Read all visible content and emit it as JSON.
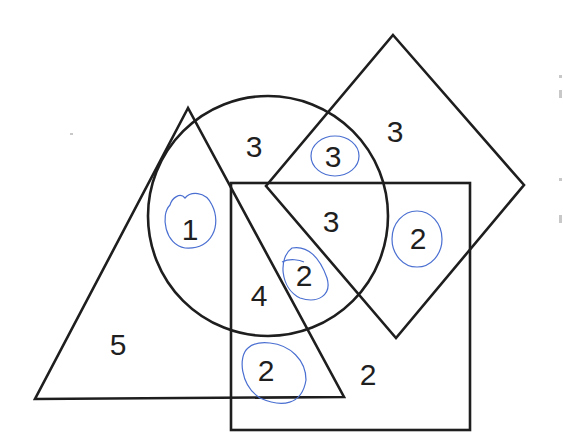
{
  "diagram": {
    "type": "venn-shapes",
    "shapes": [
      {
        "name": "triangle",
        "points": [
          [
            188,
            108
          ],
          [
            35,
            399
          ],
          [
            344,
            397
          ]
        ]
      },
      {
        "name": "circle",
        "cx": 268,
        "cy": 216,
        "r": 120
      },
      {
        "name": "square",
        "x": 231,
        "y": 183,
        "width": 239,
        "height": 247
      },
      {
        "name": "diamond",
        "points": [
          [
            393,
            35
          ],
          [
            524,
            185
          ],
          [
            396,
            338
          ],
          [
            266,
            186
          ]
        ]
      }
    ],
    "regions": [
      {
        "id": "triangle-only",
        "label": "5",
        "x": 118,
        "y": 355,
        "circled": false
      },
      {
        "id": "triangle-circle",
        "label": "1",
        "x": 190,
        "y": 240,
        "circled": true
      },
      {
        "id": "circle-only",
        "label": "3",
        "x": 254,
        "y": 157,
        "circled": false
      },
      {
        "id": "circle-diamond",
        "label": "3",
        "x": 333,
        "y": 167,
        "circled": true
      },
      {
        "id": "diamond-only",
        "label": "3",
        "x": 395,
        "y": 142,
        "circled": false
      },
      {
        "id": "circle-square-diamond",
        "label": "3",
        "x": 331,
        "y": 232,
        "circled": false
      },
      {
        "id": "square-diamond",
        "label": "2",
        "x": 418,
        "y": 249,
        "circled": true
      },
      {
        "id": "triangle-circle-square",
        "label": "4",
        "x": 259,
        "y": 306,
        "circled": false
      },
      {
        "id": "triangle-circle-square-diamond",
        "label": "2",
        "x": 304,
        "y": 286,
        "circled": true
      },
      {
        "id": "triangle-square",
        "label": "2",
        "x": 266,
        "y": 381,
        "circled": true
      },
      {
        "id": "square-only",
        "label": "2",
        "x": 368,
        "y": 385,
        "circled": false
      }
    ],
    "colors": {
      "stroke": "#1e1e1e",
      "annotation": "#4a6fd1",
      "background": "#ffffff"
    }
  }
}
